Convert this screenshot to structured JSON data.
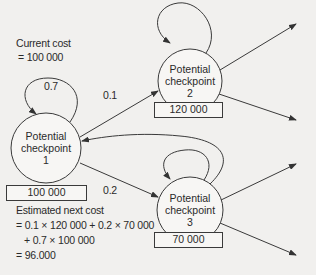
{
  "diagram": {
    "current_cost": {
      "line1": "Current cost",
      "line2": "= 100 000"
    },
    "nodes": [
      {
        "id": 1,
        "line1": "Potential",
        "line2": "checkpoint",
        "line3": "1",
        "value": "100 000",
        "self_loop_prob": "0.7"
      },
      {
        "id": 2,
        "line1": "Potential",
        "line2": "checkpoint",
        "line3": "2",
        "value": "120 000"
      },
      {
        "id": 3,
        "line1": "Potential",
        "line2": "checkpoint",
        "line3": "3",
        "value": "70 000"
      }
    ],
    "edges": [
      {
        "from": 1,
        "to": 1,
        "label": "0.7"
      },
      {
        "from": 1,
        "to": 2,
        "label": "0.1"
      },
      {
        "from": 1,
        "to": 3,
        "label": "0.2"
      },
      {
        "from": 2,
        "to": 2,
        "label": ""
      },
      {
        "from": 3,
        "to": 3,
        "label": ""
      },
      {
        "from": 3,
        "to": 1,
        "label": ""
      },
      {
        "from": 2,
        "to": "out-upper",
        "label": ""
      },
      {
        "from": 2,
        "to": "out-lower",
        "label": ""
      },
      {
        "from": 3,
        "to": "out-upper",
        "label": ""
      },
      {
        "from": 3,
        "to": "out-lower",
        "label": ""
      }
    ],
    "estimated_next_cost": {
      "line1": "Estimated next cost",
      "line2": "= 0.1 × 120 000 + 0.2 × 70 000",
      "line3": "+ 0.7 × 100 000",
      "line4": "= 96.000"
    },
    "colors": {
      "background": "#f1f0ee",
      "stroke": "#3a3a3a",
      "text": "#2a2a2a"
    }
  }
}
